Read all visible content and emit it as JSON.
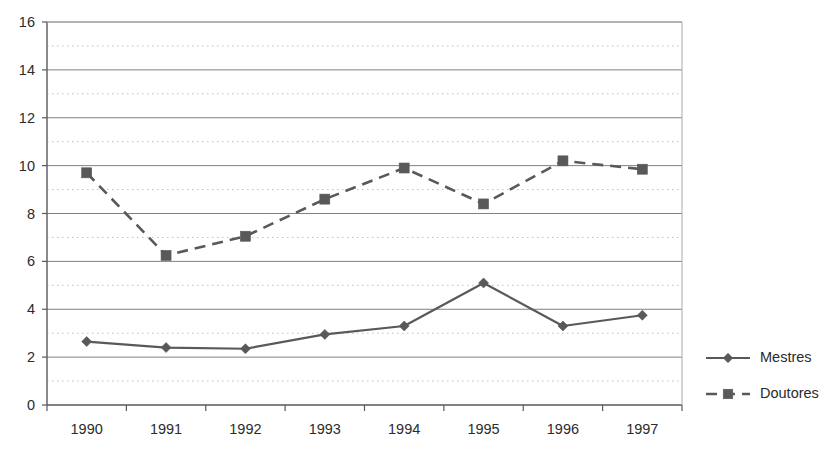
{
  "chart_data": {
    "type": "line",
    "title": "",
    "subtitle": "",
    "xlabel": "",
    "ylabel": "",
    "categories": [
      "1990",
      "1991",
      "1992",
      "1993",
      "1994",
      "1995",
      "1996",
      "1997"
    ],
    "series": [
      {
        "name": "Mestres",
        "marker": "diamond",
        "line_style": "solid",
        "color": "#595959",
        "values": [
          2.65,
          2.4,
          2.35,
          2.95,
          3.3,
          5.1,
          3.3,
          3.75
        ]
      },
      {
        "name": "Doutores",
        "marker": "square",
        "line_style": "dashed",
        "color": "#595959",
        "values": [
          9.7,
          6.25,
          7.05,
          8.6,
          9.9,
          8.4,
          10.2,
          9.85
        ]
      }
    ],
    "ylim": [
      0,
      16
    ],
    "y_major_ticks": [
      0,
      2,
      4,
      6,
      8,
      10,
      12,
      14,
      16
    ],
    "y_tick_labels": [
      "0",
      "2",
      "4",
      "6",
      "8",
      "10",
      "12",
      "14",
      "16"
    ],
    "y_minor_ticks": [
      1,
      3,
      5,
      7,
      9,
      11,
      13,
      15
    ],
    "grid": {
      "major_horizontal": true,
      "minor_horizontal_dotted": true,
      "vertical": false
    },
    "legend": {
      "position": "right",
      "entries": [
        "Mestres",
        "Doutores"
      ]
    },
    "colors": {
      "background": "#ffffff",
      "major_gridline": "#808080",
      "minor_gridline": "#bfbfbf",
      "axis": "#595959",
      "series": "#595959",
      "text": "#2b2b2b"
    }
  }
}
